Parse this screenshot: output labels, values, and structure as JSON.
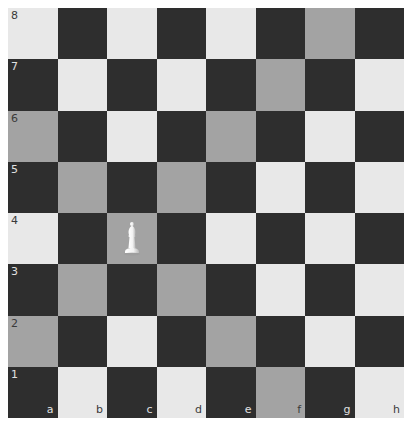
{
  "board": {
    "files": [
      "a",
      "b",
      "c",
      "d",
      "e",
      "f",
      "g",
      "h"
    ],
    "ranks": [
      "8",
      "7",
      "6",
      "5",
      "4",
      "3",
      "2",
      "1"
    ],
    "colors": {
      "light": "#e8e8e8",
      "dark": "#2e2e2e",
      "highlight": "#a3a3a3"
    },
    "highlighted_squares": [
      "g8",
      "f7",
      "a6",
      "e6",
      "b5",
      "d5",
      "c4",
      "b3",
      "d3",
      "a2",
      "e2",
      "f1"
    ],
    "pieces": [
      {
        "square": "c4",
        "type": "bishop",
        "color": "white",
        "icon": "white-bishop-icon"
      }
    ],
    "selected_square": "c4"
  }
}
